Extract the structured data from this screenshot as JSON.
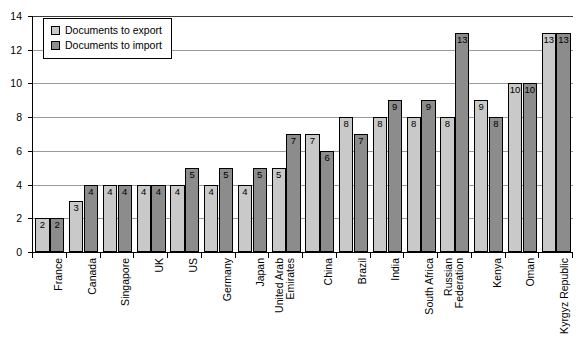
{
  "chart_data": {
    "type": "bar",
    "title": "",
    "xlabel": "",
    "ylabel": "",
    "ylim": [
      0,
      14
    ],
    "yticks": [
      0,
      2,
      4,
      6,
      8,
      10,
      12,
      14
    ],
    "grid": true,
    "legend_position": "top-left",
    "categories": [
      "France",
      "Canada",
      "Singapore",
      "UK",
      "US",
      "Germany",
      "Japan",
      "United Arab Emirates",
      "China",
      "Brazil",
      "India",
      "South Africa",
      "Russian Federation",
      "Kenya",
      "Oman",
      "Kyrgyz Republic"
    ],
    "series": [
      {
        "name": "Documents to export",
        "color": "#c9c9c9",
        "values": [
          2,
          3,
          4,
          4,
          4,
          4,
          4,
          5,
          7,
          8,
          8,
          8,
          8,
          9,
          10,
          13
        ]
      },
      {
        "name": "Documents to import",
        "color": "#8c8c8c",
        "values": [
          2,
          4,
          4,
          4,
          5,
          5,
          5,
          7,
          6,
          7,
          9,
          9,
          13,
          8,
          10,
          13
        ]
      }
    ]
  },
  "legend": {
    "items": [
      {
        "label": "Documents to export",
        "swatch": "export"
      },
      {
        "label": "Documents to import",
        "swatch": "import"
      }
    ]
  },
  "axes": {
    "y_tick_labels": [
      "0",
      "2",
      "4",
      "6",
      "8",
      "10",
      "12",
      "14"
    ]
  },
  "colors": {
    "export_bar": "#c9c9c9",
    "import_bar": "#8c8c8c",
    "axis": "#000000",
    "gridline": "#9a9a9a",
    "background": "#ffffff"
  }
}
